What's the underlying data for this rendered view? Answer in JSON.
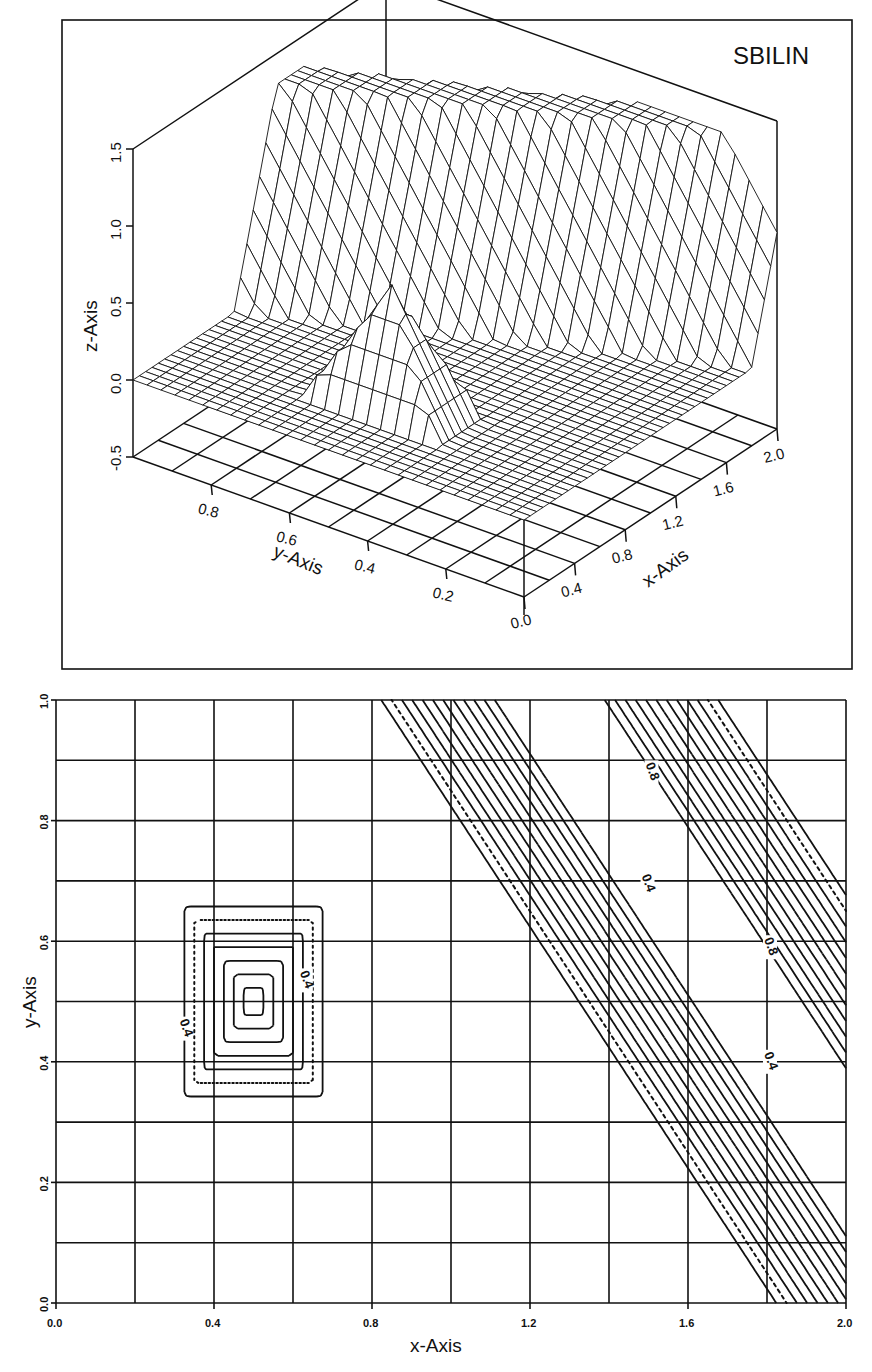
{
  "chart_data": [
    {
      "type": "surface3d",
      "title": "SBILIN",
      "xlabel": "x-Axis",
      "ylabel": "y-Axis",
      "zlabel": "z-Axis",
      "x_ticks": [
        "0.0",
        "0.4",
        "0.8",
        "1.2",
        "1.6",
        "2.0"
      ],
      "y_ticks": [
        "0.2",
        "0.4",
        "0.6",
        "0.8"
      ],
      "z_ticks": [
        "-0.5",
        "0.0",
        "0.5",
        "1.0",
        "1.5"
      ],
      "xlim": [
        0,
        2.0
      ],
      "ylim": [
        0,
        1.0
      ],
      "zlim": [
        -0.5,
        1.5
      ],
      "floor_grid": {
        "x_divisions": 10,
        "y_divisions": 10
      },
      "features": [
        {
          "name": "pyramid",
          "center_x": 0.5,
          "center_y": 0.5,
          "half_width_x": 0.2,
          "half_width_y": 0.18,
          "peak_z": 0.8
        },
        {
          "name": "diagonal-ridge",
          "from": [
            1.25,
            1.0
          ],
          "to": [
            2.0,
            0.25
          ],
          "plateau_z": 1.3,
          "plateau_halfwidth": 0.08,
          "slope_halfwidth": 0.32
        }
      ],
      "base_z": 0.0
    },
    {
      "type": "contour",
      "xlabel": "x-Axis",
      "ylabel": "y-Axis",
      "x_ticks": [
        "0.0",
        "0.4",
        "0.8",
        "1.2",
        "1.6",
        "2.0"
      ],
      "y_ticks": [
        "0.0",
        "0.2",
        "0.4",
        "0.6",
        "0.8",
        "1.0"
      ],
      "xlim": [
        0,
        2.0
      ],
      "ylim": [
        0,
        1.0
      ],
      "grid": {
        "x_step": 0.2,
        "y_step": 0.1
      },
      "contour_labels": [
        {
          "text": "0.4",
          "x": 0.63,
          "y": 0.535,
          "rotation": 70
        },
        {
          "text": "0.4",
          "x": 0.325,
          "y": 0.455,
          "rotation": 70
        },
        {
          "text": "0.8",
          "x": 1.505,
          "y": 0.88,
          "rotation": 70
        },
        {
          "text": "0.4",
          "x": 1.495,
          "y": 0.695,
          "rotation": 70
        },
        {
          "text": "0.8",
          "x": 1.805,
          "y": 0.59,
          "rotation": 70
        },
        {
          "text": "0.4",
          "x": 1.805,
          "y": 0.4,
          "rotation": 70
        }
      ]
    }
  ],
  "labels": {
    "title": "SBILIN",
    "surf_z_axis": "z-Axis",
    "surf_y_axis": "y-Axis",
    "surf_x_axis": "x-Axis",
    "contour_x_axis": "x-Axis",
    "contour_y_axis": "y-Axis"
  }
}
